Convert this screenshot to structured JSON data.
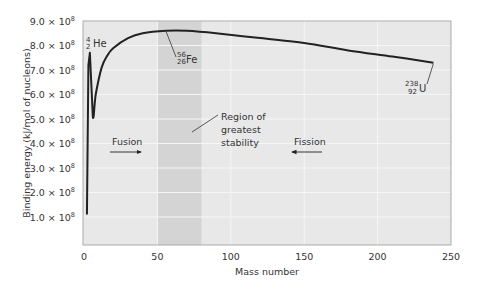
{
  "chart_data": {
    "type": "line",
    "title": "",
    "xlabel": "Mass number",
    "ylabel": "Binding energy (kJ/mol of nucleons)",
    "xlim": [
      0,
      250
    ],
    "ylim": [
      0,
      900000000.0
    ],
    "grid": true,
    "x_ticks": [
      "0",
      "50",
      "100",
      "150",
      "200",
      "250"
    ],
    "y_ticks": [
      {
        "mantissa": "1.0",
        "exp": "8"
      },
      {
        "mantissa": "2.0",
        "exp": "8"
      },
      {
        "mantissa": "3.0",
        "exp": "8"
      },
      {
        "mantissa": "4.0",
        "exp": "8"
      },
      {
        "mantissa": "5.0",
        "exp": "8"
      },
      {
        "mantissa": "6.0",
        "exp": "8"
      },
      {
        "mantissa": "7.0",
        "exp": "8"
      },
      {
        "mantissa": "8.0",
        "exp": "8"
      },
      {
        "mantissa": "9.0",
        "exp": "8"
      }
    ],
    "series": [
      {
        "name": "Binding energy per nucleon",
        "x": [
          2,
          3,
          4,
          6,
          8,
          12,
          16,
          20,
          30,
          40,
          56,
          70,
          90,
          120,
          150,
          180,
          210,
          238
        ],
        "values": [
          110000000.0,
          720000000.0,
          770000000.0,
          510000000.0,
          600000000.0,
          710000000.0,
          760000000.0,
          790000000.0,
          830000000.0,
          850000000.0,
          860000000.0,
          860000000.0,
          850000000.0,
          830000000.0,
          810000000.0,
          780000000.0,
          755000000.0,
          730000000.0
        ]
      }
    ],
    "shaded_region": {
      "x_start": 50,
      "x_end": 80,
      "label": "Region of greatest stability"
    },
    "annotations": [
      {
        "label": "He",
        "mass": "4",
        "atomic": "2",
        "x": 4,
        "y": 770000000.0
      },
      {
        "label": "Fe",
        "mass": "56",
        "atomic": "26",
        "x": 56,
        "y": 860000000.0
      },
      {
        "label": "U",
        "mass": "238",
        "atomic": "92",
        "x": 238,
        "y": 730000000.0
      },
      {
        "label": "Fusion",
        "direction": "right"
      },
      {
        "label": "Fission",
        "direction": "left"
      }
    ]
  },
  "labels": {
    "times": "×",
    "ten": "10",
    "region_line1": "Region of",
    "region_line2": "greatest",
    "region_line3": "stability",
    "fusion": "Fusion",
    "fission": "Fission"
  },
  "colors": {
    "plot_bg": "#e8e8e8",
    "band": "#d4d4d4",
    "grid": "#f6f6f6",
    "curve": "#222222",
    "frame": "#9a9a9a"
  }
}
